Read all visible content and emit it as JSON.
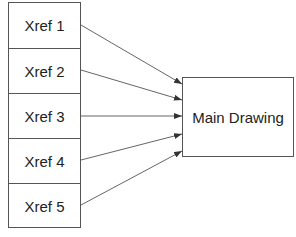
{
  "diagram": {
    "sources": [
      {
        "label": "Xref 1"
      },
      {
        "label": "Xref 2"
      },
      {
        "label": "Xref 3"
      },
      {
        "label": "Xref 4"
      },
      {
        "label": "Xref 5"
      }
    ],
    "target": {
      "label": "Main Drawing"
    },
    "edges": [
      {
        "from": "Xref 1",
        "to": "Main Drawing"
      },
      {
        "from": "Xref 2",
        "to": "Main Drawing"
      },
      {
        "from": "Xref 3",
        "to": "Main Drawing"
      },
      {
        "from": "Xref 4",
        "to": "Main Drawing"
      },
      {
        "from": "Xref 5",
        "to": "Main Drawing"
      }
    ],
    "colors": {
      "stroke": "#555555",
      "text": "#222222",
      "background": "#ffffff"
    }
  }
}
